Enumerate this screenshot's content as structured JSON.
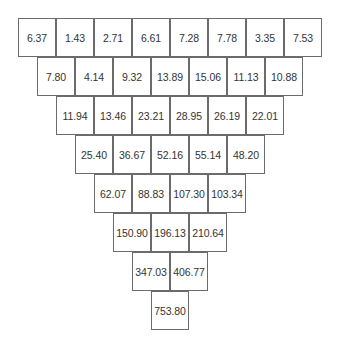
{
  "diagram": {
    "type": "number-pyramid",
    "rows": [
      [
        "6.37",
        "1.43",
        "2.71",
        "6.61",
        "7.28",
        "7.78",
        "3.35",
        "7.53"
      ],
      [
        "7.80",
        "4.14",
        "9.32",
        "13.89",
        "15.06",
        "11.13",
        "10.88"
      ],
      [
        "11.94",
        "13.46",
        "23.21",
        "28.95",
        "26.19",
        "22.01"
      ],
      [
        "25.40",
        "36.67",
        "52.16",
        "55.14",
        "48.20"
      ],
      [
        "62.07",
        "88.83",
        "107.30",
        "103.34"
      ],
      [
        "150.90",
        "196.13",
        "210.64"
      ],
      [
        "347.03",
        "406.77"
      ],
      [
        "753.80"
      ]
    ]
  }
}
